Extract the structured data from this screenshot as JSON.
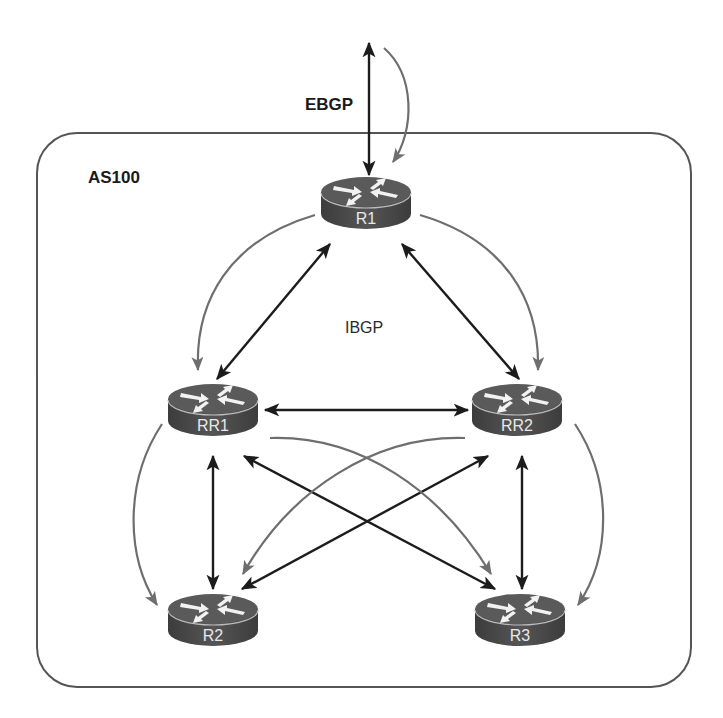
{
  "diagram": {
    "type": "bgp-route-reflector-topology",
    "labels": {
      "ebgp": "EBGP",
      "ibgp": "IBGP",
      "as_name": "AS100"
    },
    "colors": {
      "session_link": "#1c1c1c",
      "update_flow": "#6e6e6e",
      "router_body": "#4a4a4a",
      "router_top": "#5c5c5c",
      "as_border": "#555555"
    },
    "routers": [
      {
        "id": "R1",
        "label": "R1",
        "cx": 366,
        "cy": 200
      },
      {
        "id": "RR1",
        "label": "RR1",
        "cx": 213,
        "cy": 407
      },
      {
        "id": "RR2",
        "label": "RR2",
        "cx": 517,
        "cy": 407
      },
      {
        "id": "R2",
        "label": "R2",
        "cx": 213,
        "cy": 617
      },
      {
        "id": "R3",
        "label": "R3",
        "cx": 520,
        "cy": 617
      }
    ],
    "sessions": [
      {
        "from": "External",
        "to": "R1",
        "type": "EBGP"
      },
      {
        "from": "R1",
        "to": "RR1",
        "type": "IBGP"
      },
      {
        "from": "R1",
        "to": "RR2",
        "type": "IBGP"
      },
      {
        "from": "RR1",
        "to": "RR2",
        "type": "IBGP"
      },
      {
        "from": "RR1",
        "to": "R2",
        "type": "IBGP"
      },
      {
        "from": "RR1",
        "to": "R3",
        "type": "IBGP"
      },
      {
        "from": "RR2",
        "to": "R2",
        "type": "IBGP"
      },
      {
        "from": "RR2",
        "to": "R3",
        "type": "IBGP"
      }
    ],
    "update_flows": [
      {
        "from": "External",
        "to": "R1"
      },
      {
        "from": "R1",
        "to": "RR1"
      },
      {
        "from": "R1",
        "to": "RR2"
      },
      {
        "from": "RR1",
        "to": "R2"
      },
      {
        "from": "RR1",
        "to": "R3"
      },
      {
        "from": "RR2",
        "to": "R2"
      },
      {
        "from": "RR2",
        "to": "R3"
      }
    ]
  }
}
